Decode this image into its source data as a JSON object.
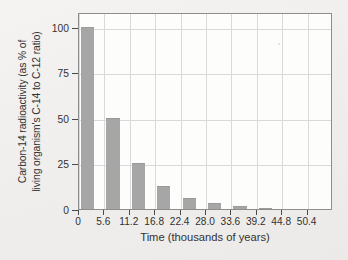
{
  "chart_data": {
    "type": "bar",
    "title": "",
    "xlabel": "Time (thousands of years)",
    "ylabel": "Carbon-14 radioactivity (as % of living organism's C-14 to C-12 ratio)",
    "ylabel_line1": "Carbon-14 radioactivity (as % of",
    "ylabel_line2": "living organism's C-14 to C-12 ratio)",
    "categories": [
      "0",
      "5.6",
      "11.2",
      "16.8",
      "22.4",
      "28.0",
      "33.6",
      "39.2",
      "44.8",
      "50.4"
    ],
    "values": [
      100,
      50,
      25,
      12.5,
      6.25,
      3.13,
      1.56,
      0.78,
      0,
      0
    ],
    "xlim": [
      0,
      56
    ],
    "ylim": [
      0,
      108
    ],
    "ytick_labels": [
      "0",
      "25",
      "50",
      "75",
      "100"
    ],
    "ytick_values": [
      0,
      25,
      50,
      75,
      100
    ],
    "xtick_labels": [
      "0",
      "5.6",
      "11.2",
      "16.8",
      "22.4",
      "28.0",
      "33.6",
      "39.2",
      "44.8",
      "50.4"
    ],
    "xtick_values": [
      0,
      5.6,
      11.2,
      16.8,
      22.4,
      28.0,
      33.6,
      39.2,
      44.8,
      50.4
    ],
    "grid": true,
    "legend": false,
    "bar_color": "#a6a6a6",
    "grid_color": "#d9d9d9",
    "axis_color": "#8d8d8f",
    "background_color": "#f2f1ef",
    "plot_background_color": "#fdfdfc",
    "half_life": 5.6,
    "bar_width_fraction": 0.52
  }
}
